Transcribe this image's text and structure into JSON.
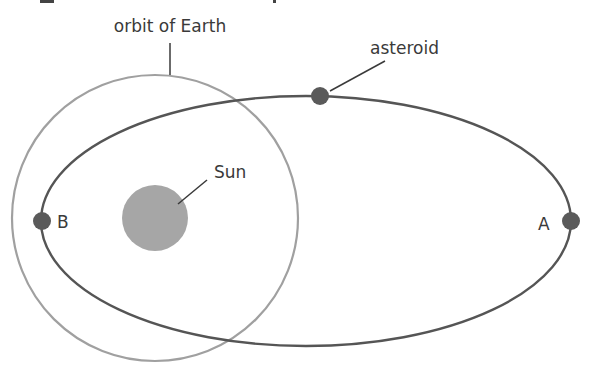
{
  "diagram": {
    "labels": {
      "earth_orbit": "orbit of Earth",
      "asteroid": "asteroid",
      "sun": "Sun",
      "point_a": "A",
      "point_b": "B"
    },
    "colors": {
      "asteroid_orbit": "#555555",
      "earth_orbit": "#a0a0a0",
      "sun": "#a6a6a6",
      "bodies": "#5a5a5a",
      "leader_lines": "#3a3a3a",
      "text": "#3a3a3a"
    }
  }
}
